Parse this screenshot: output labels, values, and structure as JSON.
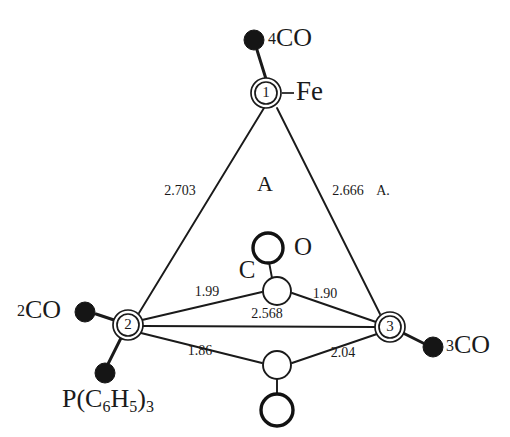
{
  "figure": {
    "label": "A",
    "unit_note": "A.",
    "central_metal_symbol": "Fe"
  },
  "vertices": [
    {
      "id": "1",
      "label": "1",
      "x": 266,
      "y": 93,
      "element_label": "Fe"
    },
    {
      "id": "2",
      "label": "2",
      "x": 128,
      "y": 325,
      "element_label": ""
    },
    {
      "id": "3",
      "label": "3",
      "x": 390,
      "y": 327,
      "element_label": ""
    }
  ],
  "ligands": [
    {
      "name": "co-4",
      "label": "4CO",
      "count": "4",
      "group": "CO",
      "x": 254,
      "y": 40
    },
    {
      "name": "co-2",
      "label": "2CO",
      "count": "2",
      "group": "CO",
      "x": 85,
      "y": 312
    },
    {
      "name": "co-3",
      "label": "3CO",
      "count": "3",
      "group": "CO",
      "x": 433,
      "y": 347
    },
    {
      "name": "phosphine",
      "label": "P(C6H5)3",
      "x": 105,
      "y": 373
    }
  ],
  "phosphine_label": {
    "prefix": "P(C",
    "sub1": "6",
    "mid": "H",
    "sub2": "5",
    "suffix": ")",
    "sub3": "3"
  },
  "bridging_atoms": [
    {
      "name": "bridge-carbon-upper",
      "label": "C",
      "x": 277,
      "y": 291
    },
    {
      "name": "bridge-oxygen-upper",
      "label": "O",
      "x": 268,
      "y": 248
    },
    {
      "name": "bridge-carbon-lower",
      "label": "",
      "x": 277,
      "y": 365
    },
    {
      "name": "bridge-oxygen-lower",
      "label": "",
      "x": 277,
      "y": 410
    }
  ],
  "distances": [
    {
      "name": "dist-fe1-fe2",
      "value": "2.703",
      "x": 180,
      "y": 192,
      "pair": "1-2"
    },
    {
      "name": "dist-fe1-fe3",
      "value": "2.666",
      "x": 348,
      "y": 192,
      "pair": "1-3"
    },
    {
      "name": "dist-fe2-fe3",
      "value": "2.568",
      "x": 267,
      "y": 315,
      "pair": "2-3"
    },
    {
      "name": "dist-fe2-cupper",
      "value": "1.99",
      "x": 207,
      "y": 293,
      "pair": "2-C(upper)"
    },
    {
      "name": "dist-fe3-cupper",
      "value": "1.90",
      "x": 325,
      "y": 295,
      "pair": "3-C(upper)"
    },
    {
      "name": "dist-fe2-clower",
      "value": "1.86",
      "x": 200,
      "y": 352,
      "pair": "2-C(lower)"
    },
    {
      "name": "dist-fe3-clower",
      "value": "2.04",
      "x": 343,
      "y": 354,
      "pair": "3-C(lower)"
    }
  ],
  "colors": {
    "ink": "#1a1a1a",
    "filled_atom": "#151515",
    "background": "#ffffff"
  }
}
